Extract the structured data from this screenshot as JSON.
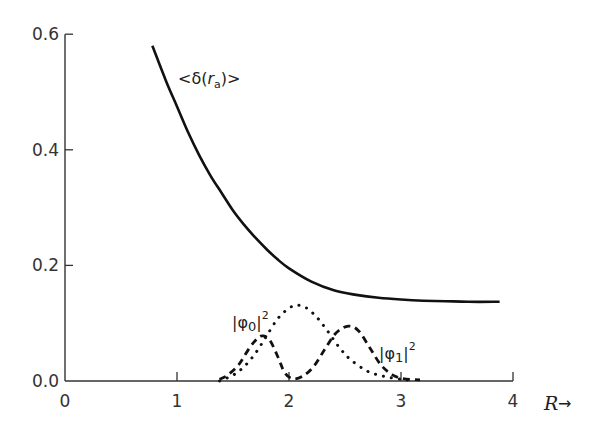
{
  "chart_data": {
    "type": "line",
    "title": "",
    "xlabel": "R",
    "ylabel": "",
    "xlim": [
      0,
      4
    ],
    "ylim": [
      0,
      0.6
    ],
    "grid": false,
    "x_ticks": [
      0,
      1,
      2,
      3,
      4
    ],
    "x_tick_labels": [
      "0",
      "1",
      "2",
      "3",
      "4"
    ],
    "y_ticks": [
      0.0,
      0.2,
      0.4,
      0.6
    ],
    "y_tick_labels": [
      "0.0",
      "0.2",
      "0.4",
      "0.6"
    ],
    "series": [
      {
        "name": "<δ(r_a)>",
        "style": "solid",
        "x": [
          0.78,
          0.9,
          1.0,
          1.1,
          1.2,
          1.3,
          1.4,
          1.5,
          1.6,
          1.7,
          1.8,
          1.9,
          2.0,
          2.2,
          2.4,
          2.6,
          2.8,
          3.0,
          3.2,
          3.4,
          3.6,
          3.88
        ],
        "y": [
          0.58,
          0.52,
          0.475,
          0.43,
          0.39,
          0.355,
          0.325,
          0.295,
          0.27,
          0.248,
          0.228,
          0.21,
          0.195,
          0.172,
          0.157,
          0.149,
          0.144,
          0.141,
          0.139,
          0.138,
          0.137,
          0.137
        ]
      },
      {
        "name": "|φ0|^2",
        "style": "dotted",
        "x": [
          1.38,
          1.5,
          1.6,
          1.7,
          1.8,
          1.9,
          2.0,
          2.07,
          2.15,
          2.25,
          2.35,
          2.45,
          2.55,
          2.7,
          2.85,
          3.0,
          3.1
        ],
        "y": [
          0.0,
          0.01,
          0.025,
          0.048,
          0.078,
          0.108,
          0.126,
          0.131,
          0.127,
          0.11,
          0.085,
          0.058,
          0.037,
          0.017,
          0.008,
          0.003,
          0.001
        ]
      },
      {
        "name": "|φ1|^2",
        "style": "dashed",
        "x": [
          1.38,
          1.45,
          1.55,
          1.65,
          1.72,
          1.77,
          1.83,
          1.9,
          1.96,
          2.03,
          2.12,
          2.22,
          2.32,
          2.42,
          2.53,
          2.62,
          2.72,
          2.82,
          2.92,
          3.02,
          3.17
        ],
        "y": [
          0.003,
          0.01,
          0.028,
          0.058,
          0.074,
          0.078,
          0.07,
          0.042,
          0.015,
          0.004,
          0.008,
          0.025,
          0.055,
          0.083,
          0.095,
          0.087,
          0.058,
          0.028,
          0.011,
          0.004,
          0.002
        ]
      }
    ],
    "annotations": [
      {
        "text": "<δ(r_a)>",
        "x": 1.55,
        "y": 0.555
      },
      {
        "text": "|φ0|^2",
        "x": 1.5,
        "y": 0.1
      },
      {
        "text": "|φ1|^2",
        "x": 2.82,
        "y": 0.045
      }
    ]
  },
  "labels": {
    "x_axis": "R",
    "x_arrow": "→",
    "delta": "<δ(",
    "delta_r": "r",
    "delta_sub": "a",
    "delta_close": ")>",
    "phi0": "|φ",
    "phi0_sub": "0",
    "phi1": "|φ",
    "phi1_sub": "1",
    "bar_close": "|",
    "sup2": "2"
  }
}
